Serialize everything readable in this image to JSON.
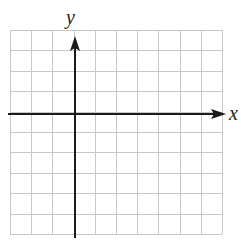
{
  "diagram": {
    "type": "coordinate-grid",
    "x_axis_label": "x",
    "y_axis_label": "y",
    "grid": {
      "columns": 10,
      "rows": 10,
      "origin_column": 3,
      "origin_row": 4,
      "line_color": "#c8c8c8",
      "axis_color": "#1a1a1a"
    }
  }
}
